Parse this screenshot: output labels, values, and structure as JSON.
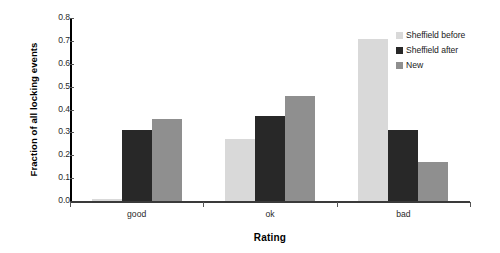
{
  "chart_data": {
    "type": "bar",
    "title": "",
    "xlabel": "Rating",
    "ylabel": "Fraction of all locking events",
    "categories": [
      "good",
      "ok",
      "bad"
    ],
    "series": [
      {
        "name": "Sheffield before",
        "color": "#d9d9d9",
        "values": [
          0.01,
          0.27,
          0.71
        ]
      },
      {
        "name": "Sheffield after",
        "color": "#282828",
        "values": [
          0.31,
          0.37,
          0.31
        ]
      },
      {
        "name": "New",
        "color": "#8f8f8f",
        "values": [
          0.36,
          0.46,
          0.17
        ]
      }
    ],
    "ylim": [
      0.0,
      0.8
    ],
    "ytick_labels": [
      "0.0",
      "0.1",
      "0.2",
      "0.3",
      "0.4",
      "0.5",
      "0.6",
      "0.7",
      "0.8"
    ],
    "ytick_values": [
      0.0,
      0.1,
      0.2,
      0.3,
      0.4,
      0.5,
      0.6,
      0.7,
      0.8
    ],
    "grid": false,
    "legend_position": "top-right"
  },
  "legend": {
    "items": [
      {
        "label": "Sheffield before",
        "color": "#d9d9d9"
      },
      {
        "label": "Sheffield after",
        "color": "#282828"
      },
      {
        "label": "New",
        "color": "#8f8f8f"
      }
    ]
  },
  "axes": {
    "x_title": "Rating",
    "y_title": "Fraction of all locking events"
  }
}
